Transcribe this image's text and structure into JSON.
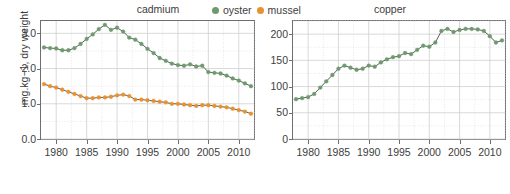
{
  "colors": {
    "oyster": "#6e9b6e",
    "mussel": "#e8912f",
    "axis": "#6e6e6e",
    "grid_major": "#cfcfcf",
    "grid_minor": "#e2e2e2",
    "text": "#3d3d3d",
    "background": "#ffffff"
  },
  "legend": {
    "items": [
      {
        "label": "oyster",
        "color": "#6e9b6e",
        "icon": "circle-marker"
      },
      {
        "label": "mussel",
        "color": "#e8912f",
        "icon": "circle-marker"
      }
    ]
  },
  "axis_label": {
    "y": "mg.kg−1, dry weight"
  },
  "panels": [
    {
      "id": "cadmium",
      "title": "cadmium",
      "ytick_labels": [
        "0.0",
        "1.0",
        "2.0",
        "3.0"
      ],
      "xtick_labels": [
        "1980",
        "1985",
        "1990",
        "1995",
        "2000",
        "2005",
        "2010"
      ]
    },
    {
      "id": "copper",
      "title": "copper",
      "ytick_labels": [
        "0",
        "50",
        "100",
        "150",
        "200"
      ],
      "xtick_labels": [
        "1980",
        "1985",
        "1990",
        "1995",
        "2000",
        "2005",
        "2010"
      ]
    }
  ],
  "chart_data": [
    {
      "type": "line",
      "id": "cadmium",
      "title": "cadmium",
      "xlabel": "",
      "ylabel": "mg.kg−1, dry weight",
      "xlim": [
        1977.5,
        2012.5
      ],
      "ylim": [
        0.0,
        3.35
      ],
      "yticks": [
        0.0,
        1.0,
        2.0,
        3.0
      ],
      "xticks": [
        1980,
        1985,
        1990,
        1995,
        2000,
        2005,
        2010
      ],
      "grid": true,
      "legend_position": "top-center",
      "x": [
        1978,
        1979,
        1980,
        1981,
        1982,
        1983,
        1984,
        1985,
        1986,
        1987,
        1988,
        1989,
        1990,
        1991,
        1992,
        1993,
        1994,
        1995,
        1996,
        1997,
        1998,
        1999,
        2000,
        2001,
        2002,
        2003,
        2004,
        2005,
        2006,
        2007,
        2008,
        2009,
        2010,
        2011,
        2012
      ],
      "series": [
        {
          "name": "oyster",
          "color": "#6e9b6e",
          "values": [
            2.6,
            2.58,
            2.57,
            2.52,
            2.52,
            2.58,
            2.7,
            2.84,
            2.97,
            3.12,
            3.24,
            3.1,
            3.16,
            3.05,
            2.88,
            2.82,
            2.7,
            2.56,
            2.44,
            2.3,
            2.22,
            2.14,
            2.1,
            2.08,
            2.12,
            2.06,
            2.08,
            1.9,
            1.88,
            1.86,
            1.8,
            1.72,
            1.66,
            1.58,
            1.5
          ]
        },
        {
          "name": "mussel",
          "color": "#e8912f",
          "values": [
            1.56,
            1.5,
            1.46,
            1.4,
            1.34,
            1.28,
            1.22,
            1.16,
            1.16,
            1.18,
            1.18,
            1.2,
            1.24,
            1.26,
            1.22,
            1.12,
            1.12,
            1.1,
            1.08,
            1.06,
            1.04,
            1.0,
            1.0,
            0.98,
            0.96,
            0.94,
            0.96,
            0.96,
            0.94,
            0.92,
            0.9,
            0.86,
            0.82,
            0.78,
            0.72
          ]
        }
      ]
    },
    {
      "type": "line",
      "id": "copper",
      "title": "copper",
      "xlabel": "",
      "ylabel": "mg.kg−1, dry weight",
      "xlim": [
        1977.5,
        2012.5
      ],
      "ylim": [
        0,
        225
      ],
      "yticks": [
        0,
        50,
        100,
        150,
        200
      ],
      "xticks": [
        1980,
        1985,
        1990,
        1995,
        2000,
        2005,
        2010
      ],
      "grid": true,
      "legend_position": "top-center",
      "x": [
        1978,
        1979,
        1980,
        1981,
        1982,
        1983,
        1984,
        1985,
        1986,
        1987,
        1988,
        1989,
        1990,
        1991,
        1992,
        1993,
        1994,
        1995,
        1996,
        1997,
        1998,
        1999,
        2000,
        2001,
        2002,
        2003,
        2004,
        2005,
        2006,
        2007,
        2008,
        2009,
        2010,
        2011,
        2012
      ],
      "series": [
        {
          "name": "oyster",
          "color": "#6e9b6e",
          "values": [
            76,
            78,
            80,
            86,
            98,
            110,
            122,
            134,
            140,
            136,
            132,
            134,
            140,
            138,
            146,
            152,
            156,
            158,
            164,
            162,
            170,
            178,
            176,
            184,
            206,
            210,
            204,
            208,
            210,
            210,
            209,
            206,
            196,
            184,
            188
          ]
        }
      ]
    }
  ]
}
